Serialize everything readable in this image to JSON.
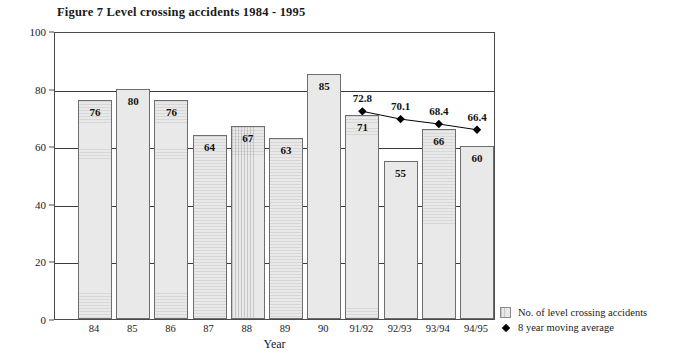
{
  "chart_data": {
    "type": "bar",
    "title": "Figure 7  Level crossing accidents 1984 - 1995",
    "xlabel": "Year",
    "ylabel": "",
    "ylim": [
      0,
      100
    ],
    "yticks": [
      0,
      20,
      40,
      60,
      80,
      100
    ],
    "grid": true,
    "legend_position": "right-bottom",
    "categories": [
      "84",
      "85",
      "86",
      "87",
      "88",
      "89",
      "90",
      "91/92",
      "92/93",
      "93/94",
      "94/95"
    ],
    "series": [
      {
        "name": "No. of level crossing accidents",
        "type": "bar",
        "values": [
          76,
          80,
          76,
          64,
          67,
          63,
          85,
          71,
          55,
          66,
          60
        ],
        "labels": [
          "76",
          "80",
          "76",
          "64",
          "67",
          "63",
          "85",
          "71",
          "55",
          "66",
          "60"
        ],
        "color": "#e9e9e9"
      },
      {
        "name": "8 year moving average",
        "type": "line",
        "x": [
          "91/92",
          "92/93",
          "93/94",
          "94/95"
        ],
        "values": [
          72.8,
          70.1,
          68.4,
          66.4
        ],
        "labels": [
          "72.8",
          "70.1",
          "68.4",
          "66.4"
        ],
        "marker": "diamond",
        "color": "#000000"
      }
    ]
  },
  "legend": {
    "items": [
      {
        "label": "No. of level crossing accidents",
        "marker": "square-swatch"
      },
      {
        "label": "8 year moving average",
        "marker": "diamond"
      }
    ]
  }
}
